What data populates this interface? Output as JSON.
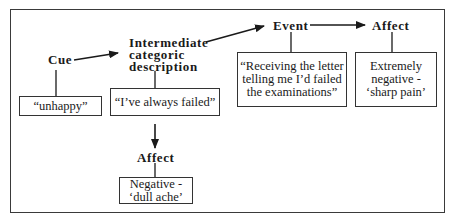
{
  "diagram": {
    "nodes": {
      "cue": {
        "label": "Cue",
        "example": "“unhappy”"
      },
      "intermediate": {
        "label_lines": [
          "Intermediate",
          "categoric",
          "description"
        ],
        "example": "“I’ve always failed”"
      },
      "event": {
        "label": "Event",
        "example_lines": [
          "“Receiving the letter",
          "telling me I’d failed",
          "the examinations”"
        ]
      },
      "affect_top": {
        "label": "Affect",
        "example_lines": [
          "Extremely",
          "negative -",
          "‘sharp pain’"
        ]
      },
      "affect_bottom": {
        "label": "Affect",
        "example_lines": [
          "Negative -",
          "‘dull ache’"
        ]
      }
    },
    "edges": [
      {
        "from": "cue",
        "to": "intermediate"
      },
      {
        "from": "intermediate",
        "to": "event"
      },
      {
        "from": "event",
        "to": "affect_top"
      },
      {
        "from": "intermediate",
        "to": "affect_bottom"
      }
    ]
  }
}
